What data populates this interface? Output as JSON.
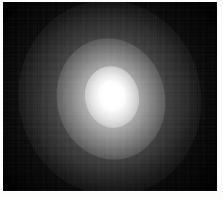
{
  "figure": {
    "title": "",
    "caption": "",
    "alt_text": "Grayscale astronomical image of a diffuse bright source with a saturated core and extended elliptical halo on a black sky background",
    "colormap": "grayscale",
    "background_color": "#000000",
    "peak_color": "#ffffff",
    "frame_color": "#fdfdfb"
  },
  "image_plate": {
    "width_px": 214,
    "height_px": 189,
    "offset_left_px": 3,
    "offset_top_px": 2,
    "border_color": "#fdfdfb"
  },
  "source": {
    "label": "",
    "center_x_px": 110,
    "center_y_px": 94,
    "core_radius_px": 14,
    "halo_radius_px": 62,
    "envelope_radius_px": 105,
    "position_angle_deg": -12,
    "axis_ratio": 0.88,
    "peak_intensity": 255,
    "background_intensity": 4
  },
  "noise": {
    "type": "block-compression",
    "visible": true,
    "block_size_px": 8
  },
  "annotations": [],
  "axes": {
    "visible": false,
    "tick_labels": [],
    "x_label": "",
    "y_label": ""
  },
  "colorbar": {
    "visible": false,
    "min_label": "",
    "max_label": ""
  }
}
